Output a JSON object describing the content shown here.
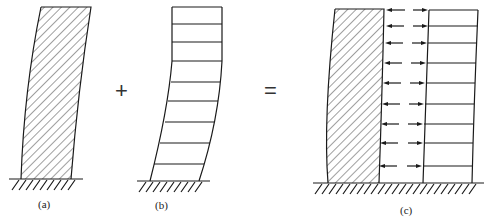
{
  "figure": {
    "panels": [
      {
        "id": "a",
        "label": "(a)",
        "description": "Shear wall under lateral load (flexural deformation)"
      },
      {
        "id": "b",
        "label": "(b)",
        "description": "Frame under lateral load (shear deformation)"
      },
      {
        "id": "c",
        "label": "(c)",
        "description": "Frame–shear wall interaction with interaction forces"
      }
    ],
    "operators": {
      "plus": "+",
      "equals": "="
    },
    "colors": {
      "line": "#1a1a1a",
      "background": "#ffffff"
    }
  }
}
